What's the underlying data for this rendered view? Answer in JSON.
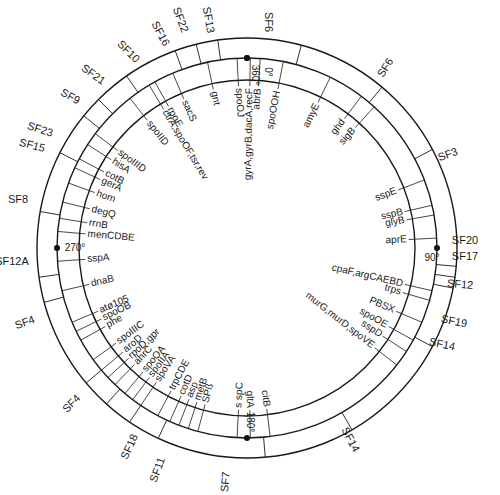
{
  "figure": {
    "type": "circular genetic map",
    "degree_marks": [
      {
        "label": "0°",
        "angle": 0
      },
      {
        "label": "360°",
        "angle": 0
      },
      {
        "label": "90°",
        "angle": 90
      },
      {
        "label": "180°",
        "angle": 180
      },
      {
        "label": "270°",
        "angle": 270
      }
    ],
    "genes": [
      {
        "label": "abrB",
        "angle": 4
      },
      {
        "label": "gyrA,gyrB,dacA,recF",
        "angle": 1
      },
      {
        "label": "spoOJ",
        "angle": 357
      },
      {
        "label": "gnt",
        "angle": 348
      },
      {
        "label": "sacS",
        "angle": 337
      },
      {
        "label": "rpoE",
        "angle": 331
      },
      {
        "label": "ctrA,spoOF,tsr,rev",
        "angle": 329
      },
      {
        "label": "spoIID",
        "angle": 322
      },
      {
        "label": "spoIIID",
        "angle": 307
      },
      {
        "label": "hisA",
        "angle": 303
      },
      {
        "label": "cotB",
        "angle": 298
      },
      {
        "label": "gerA",
        "angle": 295
      },
      {
        "label": "hom",
        "angle": 290
      },
      {
        "label": "degQ",
        "angle": 284
      },
      {
        "label": "rrnB",
        "angle": 279
      },
      {
        "label": "menCDBE",
        "angle": 275
      },
      {
        "label": "sspA",
        "angle": 266
      },
      {
        "label": "dnaB",
        "angle": 257
      },
      {
        "label": "atø105",
        "angle": 247
      },
      {
        "label": "spoOB",
        "angle": 244
      },
      {
        "label": "phe",
        "angle": 241
      },
      {
        "label": "spoIIIC",
        "angle": 234
      },
      {
        "label": "aroD",
        "angle": 230
      },
      {
        "label": "rpoD,gpr",
        "angle": 227
      },
      {
        "label": "ahrC",
        "angle": 224
      },
      {
        "label": "spoOA",
        "angle": 220
      },
      {
        "label": "spoIIA",
        "angle": 217
      },
      {
        "label": "spoVA",
        "angle": 214
      },
      {
        "label": "trpCDE",
        "angle": 208
      },
      {
        "label": "cotD",
        "angle": 204
      },
      {
        "label": "asp",
        "angle": 201
      },
      {
        "label": "metB",
        "angle": 198
      },
      {
        "label": "SPß",
        "angle": 195
      },
      {
        "label": "s spC",
        "angle": 183
      },
      {
        "label": "gltA",
        "angle": 179
      },
      {
        "label": "citB",
        "angle": 173
      },
      {
        "label": "murG,murD,spoVE",
        "angle": 128
      },
      {
        "label": "sspD",
        "angle": 123
      },
      {
        "label": "spoOE",
        "angle": 119
      },
      {
        "label": "PBSX",
        "angle": 113
      },
      {
        "label": "trps",
        "angle": 106
      },
      {
        "label": "cpaF,argCAEBD",
        "angle": 103
      },
      {
        "label": "aprE",
        "angle": 87
      },
      {
        "label": "glyB",
        "angle": 80
      },
      {
        "label": "sspB",
        "angle": 77
      },
      {
        "label": "sspE",
        "angle": 69
      },
      {
        "label": "sigB",
        "angle": 42
      },
      {
        "label": "ghd",
        "angle": 37
      },
      {
        "label": "amyE",
        "angle": 26
      },
      {
        "label": "spoOOH",
        "angle": 11
      }
    ],
    "sf_labels": [
      {
        "label": "SF6",
        "x": 268,
        "y": 22,
        "rot": 90
      },
      {
        "label": "SF6",
        "x": 386,
        "y": 68,
        "rot": -58
      },
      {
        "label": "SF13",
        "x": 208,
        "y": 20,
        "rot": 80
      },
      {
        "label": "SF22",
        "x": 180,
        "y": 20,
        "rot": 70
      },
      {
        "label": "SF16",
        "x": 160,
        "y": 34,
        "rot": 62
      },
      {
        "label": "SF10",
        "x": 128,
        "y": 52,
        "rot": 45
      },
      {
        "label": "SF21",
        "x": 93,
        "y": 75,
        "rot": 35
      },
      {
        "label": "SF9",
        "x": 70,
        "y": 97,
        "rot": 30
      },
      {
        "label": "SF23",
        "x": 40,
        "y": 130,
        "rot": 18
      },
      {
        "label": "SF15",
        "x": 32,
        "y": 146,
        "rot": 15
      },
      {
        "label": "SF8",
        "x": 18,
        "y": 200,
        "rot": 0
      },
      {
        "label": "SF12A",
        "x": 12,
        "y": 262,
        "rot": 0
      },
      {
        "label": "SF4",
        "x": 25,
        "y": 323,
        "rot": -20
      },
      {
        "label": "SF4",
        "x": 72,
        "y": 404,
        "rot": -45
      },
      {
        "label": "SF18",
        "x": 130,
        "y": 447,
        "rot": -65
      },
      {
        "label": "SF11",
        "x": 158,
        "y": 470,
        "rot": -70
      },
      {
        "label": "SF7",
        "x": 226,
        "y": 482,
        "rot": -85
      },
      {
        "label": "SF14",
        "x": 350,
        "y": 440,
        "rot": 62
      },
      {
        "label": "SF14",
        "x": 442,
        "y": 345,
        "rot": 12
      },
      {
        "label": "SF19",
        "x": 454,
        "y": 322,
        "rot": 12
      },
      {
        "label": "SF12",
        "x": 460,
        "y": 285,
        "rot": 5
      },
      {
        "label": "SF17",
        "x": 465,
        "y": 257,
        "rot": 0
      },
      {
        "label": "SF20",
        "x": 465,
        "y": 241,
        "rot": 0
      },
      {
        "label": "SF3",
        "x": 448,
        "y": 155,
        "rot": -20
      }
    ]
  }
}
